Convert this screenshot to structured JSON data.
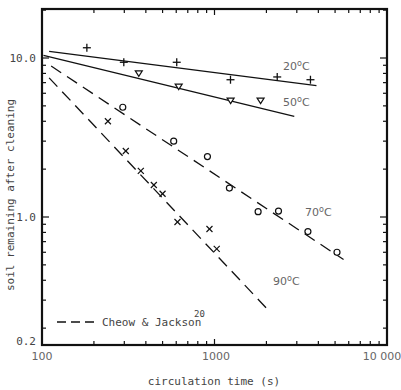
{
  "chart_data": {
    "type": "scatter",
    "title": "",
    "xlabel": "circulation time (s)",
    "ylabel": "soil remaining after cleaning",
    "xscale": "log",
    "yscale": "log",
    "xlim": [
      100,
      10000
    ],
    "ylim": [
      0.2,
      20
    ],
    "x_tick_labels": [
      "100",
      "1000",
      "10 000"
    ],
    "y_tick_labels": [
      "10.0",
      "1.0",
      "0.2"
    ],
    "legend": {
      "position": "lower-left",
      "entries": [
        {
          "label": "Cheow & Jackson",
          "superscript": "20",
          "style": "dashed"
        }
      ]
    },
    "series": [
      {
        "name": "20°C",
        "label": "20",
        "marker": "plus",
        "fit_line": "solid",
        "points": [
          [
            182,
            11.6
          ],
          [
            298,
            9.4
          ],
          [
            604,
            9.4
          ],
          [
            1238,
            7.3
          ],
          [
            2310,
            7.6
          ],
          [
            3600,
            7.3
          ]
        ],
        "fit": [
          [
            110,
            11.0
          ],
          [
            3900,
            6.7
          ]
        ]
      },
      {
        "name": "50°C",
        "label": "50",
        "marker": "triangle-down",
        "fit_line": "solid",
        "points": [
          [
            364,
            8.0
          ],
          [
            620,
            6.6
          ],
          [
            1240,
            5.4
          ],
          [
            1850,
            5.4
          ]
        ],
        "fit": [
          [
            102,
            10.4
          ],
          [
            2900,
            4.3
          ]
        ]
      },
      {
        "name": "70°C",
        "label": "70",
        "marker": "circle",
        "fit_line": "dashed",
        "points": [
          [
            294,
            4.9
          ],
          [
            580,
            3.0
          ],
          [
            910,
            2.4
          ],
          [
            1220,
            1.52
          ],
          [
            1790,
            1.08
          ],
          [
            2350,
            1.09
          ],
          [
            3480,
            0.81
          ],
          [
            5130,
            0.6
          ]
        ],
        "fit": [
          [
            113,
            8.9
          ],
          [
            5600,
            0.54
          ]
        ]
      },
      {
        "name": "90°C",
        "label": "90",
        "marker": "cross",
        "fit_line": "dashed",
        "points": [
          [
            241,
            4.0
          ],
          [
            306,
            2.6
          ],
          [
            374,
            1.95
          ],
          [
            445,
            1.59
          ],
          [
            500,
            1.4
          ],
          [
            610,
            0.93
          ],
          [
            935,
            0.84
          ],
          [
            1030,
            0.63
          ]
        ],
        "fit": [
          [
            110,
            7.5
          ],
          [
            2120,
            0.25
          ]
        ]
      }
    ]
  },
  "labels": {
    "unit_sup": "o",
    "unit": "C",
    "legend_text": "Cheow & Jackson",
    "legend_ref": "20"
  }
}
